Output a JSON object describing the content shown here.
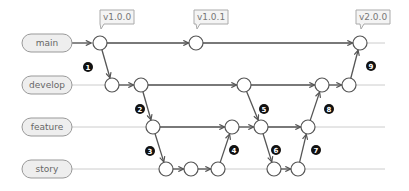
{
  "branches": [
    {
      "name": "main",
      "y": 43
    },
    {
      "name": "develop",
      "y": 85
    },
    {
      "name": "feature",
      "y": 127
    },
    {
      "name": "story",
      "y": 169
    }
  ],
  "tags": [
    {
      "label": "v1.0.0",
      "x": 117,
      "y": 17,
      "node": "m1"
    },
    {
      "label": "v1.0.1",
      "x": 211,
      "y": 17,
      "node": "m2"
    },
    {
      "label": "v2.0.0",
      "x": 373,
      "y": 17,
      "node": "m3"
    }
  ],
  "nodes": {
    "m1": [
      100,
      43
    ],
    "m2": [
      196,
      43
    ],
    "m3": [
      360,
      43
    ],
    "d1": [
      112,
      85
    ],
    "d2": [
      141,
      85
    ],
    "d3": [
      244,
      85
    ],
    "d4": [
      322,
      85
    ],
    "d5": [
      349,
      85
    ],
    "f1": [
      153,
      127
    ],
    "f2": [
      232,
      127
    ],
    "f3": [
      261,
      127
    ],
    "f4": [
      308,
      127
    ],
    "s1": [
      166,
      169
    ],
    "s2": [
      191,
      169
    ],
    "s3": [
      218,
      169
    ],
    "s4": [
      274,
      169
    ],
    "s5": [
      298,
      169
    ]
  },
  "edges": [
    [
      "m1",
      "m2"
    ],
    [
      "m2",
      "m3"
    ],
    [
      "m1",
      "d1"
    ],
    [
      "d1",
      "d2"
    ],
    [
      "d2",
      "d3"
    ],
    [
      "d3",
      "d4"
    ],
    [
      "d4",
      "d5"
    ],
    [
      "d5",
      "m3"
    ],
    [
      "d2",
      "f1"
    ],
    [
      "f1",
      "f2"
    ],
    [
      "f2",
      "f3"
    ],
    [
      "f3",
      "f4"
    ],
    [
      "f1",
      "s1"
    ],
    [
      "s1",
      "s2"
    ],
    [
      "s2",
      "s3"
    ],
    [
      "s3",
      "f2"
    ],
    [
      "d3",
      "f3"
    ],
    [
      "f3",
      "s4"
    ],
    [
      "s4",
      "s5"
    ],
    [
      "s5",
      "f4"
    ],
    [
      "f4",
      "d4"
    ]
  ],
  "steps": [
    {
      "label": "1",
      "x": 88,
      "y": 67
    },
    {
      "label": "2",
      "x": 140,
      "y": 109
    },
    {
      "label": "3",
      "x": 150,
      "y": 151
    },
    {
      "label": "4",
      "x": 234,
      "y": 150
    },
    {
      "label": "5",
      "x": 264,
      "y": 109
    },
    {
      "label": "6",
      "x": 276,
      "y": 150
    },
    {
      "label": "7",
      "x": 316,
      "y": 150
    },
    {
      "label": "8",
      "x": 329,
      "y": 109
    },
    {
      "label": "9",
      "x": 371,
      "y": 66
    }
  ],
  "colors": {
    "line": "#555555",
    "branch_track": "#cccccc",
    "label_fill": "#eeeeee",
    "label_stroke": "#999999",
    "step_fill": "#111111"
  }
}
